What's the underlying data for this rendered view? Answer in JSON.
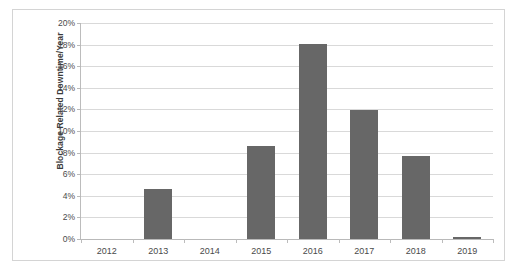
{
  "chart_data": {
    "type": "bar",
    "title": "",
    "xlabel": "",
    "ylabel": "Blockage Related Downtime/Year",
    "categories": [
      "2012",
      "2013",
      "2014",
      "2015",
      "2016",
      "2017",
      "2018",
      "2019"
    ],
    "values": [
      0,
      4.6,
      0,
      8.6,
      18.1,
      11.9,
      7.7,
      0.2
    ],
    "value_unit": "%",
    "ylim": [
      0,
      20
    ],
    "ytick_values": [
      0,
      2,
      4,
      6,
      8,
      10,
      12,
      14,
      16,
      18,
      20
    ],
    "ytick_labels": [
      "0%",
      "2%",
      "4%",
      "6%",
      "8%",
      "10%",
      "12%",
      "14%",
      "16%",
      "18%",
      "20%"
    ],
    "grid": true,
    "legend": "none",
    "series": [
      {
        "name": "Blockage Related Downtime/Year",
        "color": "#676767",
        "values": [
          0,
          4.6,
          0,
          8.6,
          18.1,
          11.9,
          7.7,
          0.2
        ]
      }
    ],
    "colors": {
      "bar": "#676767",
      "gridline": "#d9d9d9",
      "axis": "#bcbcbc",
      "frame_border": "#d4d4d4",
      "background": "#ffffff",
      "tick_text": "#4a4a4a",
      "axis_title_text": "#3a3a3a"
    }
  }
}
